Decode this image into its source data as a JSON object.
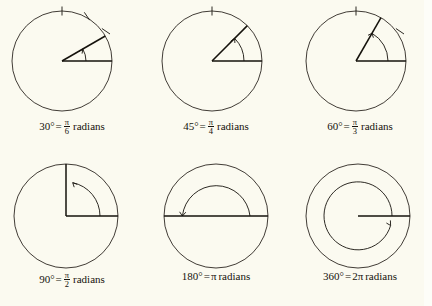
{
  "figure": {
    "background_color": "#fbfaf0",
    "ink_color": "#15120c",
    "circle_stroke_color": "#2b2620",
    "title": ""
  },
  "panels": [
    {
      "id": "angle-30",
      "degrees": "30°",
      "equals": "=",
      "numerator": "π",
      "denominator": "6",
      "radians_word": "radians",
      "angle_value": 30,
      "tick_count": 3,
      "tick_angles": [
        90,
        60,
        30
      ],
      "arc_direction": "counterclockwise",
      "full_label": "30° = π/6 radians"
    },
    {
      "id": "angle-45",
      "degrees": "45°",
      "equals": "=",
      "numerator": "π",
      "denominator": "4",
      "radians_word": "radians",
      "angle_value": 45,
      "tick_count": 1,
      "tick_angles": [
        90
      ],
      "arc_direction": "counterclockwise",
      "full_label": "45° = π/4 radians"
    },
    {
      "id": "angle-60",
      "degrees": "60°",
      "equals": "=",
      "numerator": "π",
      "denominator": "3",
      "radians_word": "radians",
      "angle_value": 60,
      "tick_count": 2,
      "tick_angles": [
        90,
        30
      ],
      "arc_direction": "counterclockwise",
      "full_label": "60° = π/3 radians"
    },
    {
      "id": "angle-90",
      "degrees": "90°",
      "equals": "=",
      "numerator": "π",
      "denominator": "2",
      "radians_word": "radians",
      "angle_value": 90,
      "tick_count": 0,
      "tick_angles": [],
      "arc_direction": "counterclockwise",
      "full_label": "90° = π/2 radians"
    },
    {
      "id": "angle-180",
      "degrees": "180°",
      "equals": "=",
      "numerator": null,
      "denominator": null,
      "pi_text": "π",
      "radians_word": "radians",
      "angle_value": 180,
      "tick_count": 0,
      "tick_angles": [],
      "arc_direction": "counterclockwise",
      "full_label": "180° = π radians"
    },
    {
      "id": "angle-360",
      "degrees": "360°",
      "equals": "=",
      "numerator": null,
      "denominator": null,
      "pi_text": "2π",
      "radians_word": "radians",
      "angle_value": 360,
      "tick_count": 0,
      "tick_angles": [],
      "arc_direction": "counterclockwise",
      "full_label": "360° = 2π radians"
    }
  ]
}
